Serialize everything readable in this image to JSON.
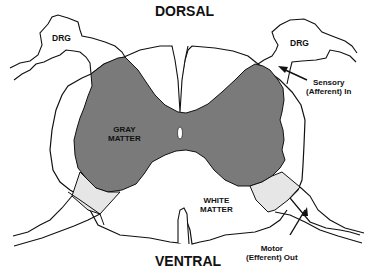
{
  "diagram": {
    "title_top": "DORSAL",
    "title_bottom": "VENTRAL",
    "labels": {
      "drg_left": "DRG",
      "drg_right": "DRG",
      "gray_matter_line1": "GRAY",
      "gray_matter_line2": "MATTER",
      "white_matter_line1": "WHITE",
      "white_matter_line2": "MATTER",
      "sensory_line1": "Sensory",
      "sensory_line2": "(Afferent) In",
      "motor_line1": "Motor",
      "motor_line2": "(Efferent) Out"
    },
    "colors": {
      "gray_matter": "#7a7a7a",
      "root_entry_zone": "#e6e6e6",
      "outline": "#111111",
      "background": "#ffffff"
    }
  }
}
